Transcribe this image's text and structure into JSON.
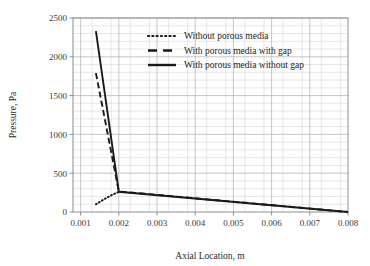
{
  "chart_data": {
    "type": "line",
    "title": "",
    "xlabel": "Axial Location, m",
    "ylabel": "Pressure, Pa",
    "xlim": [
      0.0008,
      0.008
    ],
    "ylim": [
      0,
      2500
    ],
    "xticks": [
      0.001,
      0.002,
      0.003,
      0.004,
      0.005,
      0.006,
      0.007,
      0.008
    ],
    "xtick_labels": [
      "0.001",
      "0.002",
      "0.003",
      "0.004",
      "0.005",
      "0.006",
      "0.007",
      "0.008"
    ],
    "yticks": [
      0,
      500,
      1000,
      1500,
      2000,
      2500
    ],
    "ytick_labels": [
      "0",
      "500",
      "1000",
      "1500",
      "2000",
      "2500"
    ],
    "grid": true,
    "grid_minor_x_step": 0.0005,
    "grid_minor_y_step": 100,
    "legend_position": "top-center",
    "series": [
      {
        "name": "Without porous media",
        "style": "dotted",
        "color": "#1a1a1a",
        "x": [
          0.0014,
          0.0016,
          0.0018,
          0.002
        ],
        "y": [
          100,
          160,
          215,
          260
        ]
      },
      {
        "name": "With porous media with gap",
        "style": "dashed",
        "color": "#1a1a1a",
        "x": [
          0.0014,
          0.002,
          0.008
        ],
        "y": [
          1790,
          265,
          0
        ]
      },
      {
        "name": "With porous media without gap",
        "style": "solid",
        "color": "#1a1a1a",
        "x": [
          0.0014,
          0.002,
          0.008
        ],
        "y": [
          2330,
          260,
          0
        ]
      }
    ]
  },
  "legend": {
    "entries": [
      {
        "label": "Without porous media",
        "style": "dotted"
      },
      {
        "label": "With porous media with gap",
        "style": "dashed"
      },
      {
        "label": "With porous media without gap",
        "style": "solid"
      }
    ]
  },
  "axes": {
    "x_title": "Axial Location, m",
    "y_title": "Pressure, Pa"
  },
  "colors": {
    "ink": "#231f20",
    "series": "#1a1a1a",
    "frame": "#8c8c8c",
    "grid_major": "#b8b8b8",
    "grid_minor": "#dcdcdc",
    "background": "#ffffff"
  }
}
